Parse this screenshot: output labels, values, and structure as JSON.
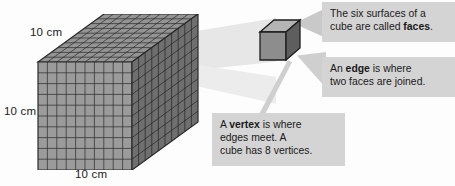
{
  "figure": {
    "title_visible": false
  },
  "dimensions": {
    "top_label": "10 cm",
    "left_label": "10 cm",
    "bottom_label": "10 cm"
  },
  "callouts": [
    {
      "id": "faces",
      "line1_pre": "The six surfaces of a",
      "line2_pre": "cube are called ",
      "line2_bold": "faces",
      "line2_post": "."
    },
    {
      "id": "edge",
      "line1_pre": "An ",
      "line1_bold": "edge",
      "line1_post": " is where",
      "line2": "two faces are joined."
    },
    {
      "id": "vertex",
      "line1_pre": "A ",
      "line1_bold": "vertex",
      "line1_post": " is where",
      "line2": "edges meet. A",
      "line3": "cube has 8 vertices."
    }
  ],
  "cube_model": {
    "units_per_edge": 10,
    "big_cube_name": "10 by 10 by 10 unit cube",
    "small_cube_name": "single unit cube"
  },
  "colors": {
    "callout_bg": "#d4d4d4",
    "text": "#1a1a1a",
    "cube_top": "#8f8f8f",
    "cube_front": "#9a9a9a",
    "cube_right": "#707070",
    "grid_line": "#2e2e2e",
    "connector": "#cfcfcf"
  }
}
